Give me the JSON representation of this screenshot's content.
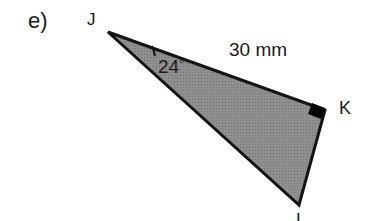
{
  "figure": {
    "part_label": "e)",
    "background_color": "#ffffff",
    "ink_color": "#1a1a1a",
    "shape": {
      "kind": "triangle",
      "name": "triangle-jkl",
      "fill_color": "#8a8a8a",
      "stroke_color": "#141414",
      "stroke_width": 3,
      "texture": "halftone-dither",
      "vertices": [
        {
          "name": "J",
          "x": 108,
          "y": 32
        },
        {
          "name": "K",
          "x": 325,
          "y": 110
        },
        {
          "name": "L",
          "x": 299,
          "y": 205
        }
      ]
    },
    "vertex_labels": [
      {
        "name": "J",
        "text": "J"
      },
      {
        "name": "K",
        "text": "K"
      },
      {
        "name": "L",
        "text": "L",
        "clipped": "bottom"
      }
    ],
    "angle_marks": [
      {
        "name": "angle-at-j",
        "at_vertex": "J",
        "value": "24",
        "unit": "°",
        "text": "24",
        "degree_symbol": "°",
        "marker": "arc"
      }
    ],
    "right_angle_marks": [
      {
        "name": "right-angle-at-k",
        "at_vertex": "K",
        "marker": "filled-square",
        "color": "#000000"
      }
    ],
    "side_labels": [
      {
        "name": "side-jk-length",
        "side": "JK",
        "text": "30 mm",
        "value": "30",
        "unit": "mm"
      }
    ]
  }
}
